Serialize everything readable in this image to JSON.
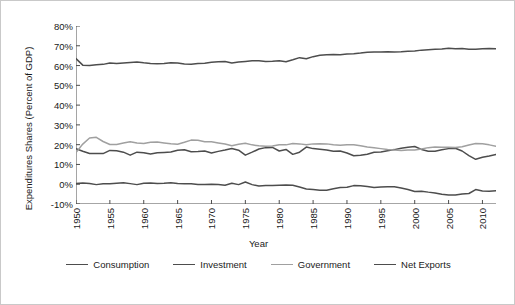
{
  "chart_data": {
    "type": "line",
    "title": "",
    "xlabel": "Year",
    "ylabel": "Expenditures Shares (Percent of GDP)",
    "xlim": [
      1950,
      2012
    ],
    "ylim": [
      -10,
      80
    ],
    "grid": false,
    "legend_position": "bottom",
    "ytick_labels": [
      "80%",
      "70%",
      "60%",
      "50%",
      "40%",
      "30%",
      "20%",
      "10%",
      "0%",
      "-10%"
    ],
    "ytick_values": [
      80,
      70,
      60,
      50,
      40,
      30,
      20,
      10,
      0,
      -10
    ],
    "xtick_labels": [
      "1950",
      "1955",
      "1960",
      "1965",
      "1970",
      "1975",
      "1980",
      "1985",
      "1990",
      "1995",
      "2000",
      "2005",
      "2010"
    ],
    "xtick_values": [
      1950,
      1955,
      1960,
      1965,
      1970,
      1975,
      1980,
      1985,
      1990,
      1995,
      2000,
      2005,
      2010
    ],
    "x": [
      1950,
      1951,
      1952,
      1953,
      1954,
      1955,
      1956,
      1957,
      1958,
      1959,
      1960,
      1961,
      1962,
      1963,
      1964,
      1965,
      1966,
      1967,
      1968,
      1969,
      1970,
      1971,
      1972,
      1973,
      1974,
      1975,
      1976,
      1977,
      1978,
      1979,
      1980,
      1981,
      1982,
      1983,
      1984,
      1985,
      1986,
      1987,
      1988,
      1989,
      1990,
      1991,
      1992,
      1993,
      1994,
      1995,
      1996,
      1997,
      1998,
      1999,
      2000,
      2001,
      2002,
      2003,
      2004,
      2005,
      2006,
      2007,
      2008,
      2009,
      2010,
      2011,
      2012
    ],
    "series": [
      {
        "name": "Consumption",
        "color": "#4d4d4d",
        "values": [
          63.5,
          60.2,
          60.0,
          60.4,
          60.6,
          61.3,
          61.0,
          61.3,
          61.6,
          61.8,
          61.4,
          61.1,
          60.9,
          61.0,
          61.4,
          61.3,
          60.8,
          60.7,
          61.0,
          61.2,
          61.7,
          61.9,
          62.0,
          61.3,
          61.8,
          62.1,
          62.4,
          62.4,
          62.1,
          62.2,
          62.4,
          61.9,
          62.9,
          64.0,
          63.4,
          64.5,
          65.2,
          65.5,
          65.6,
          65.5,
          65.9,
          66.0,
          66.3,
          66.7,
          66.9,
          66.9,
          67.0,
          66.9,
          67.0,
          67.2,
          67.4,
          67.8,
          68.0,
          68.2,
          68.4,
          68.8,
          68.5,
          68.6,
          68.2,
          68.2,
          68.5,
          68.6,
          68.5
        ]
      },
      {
        "name": "Investment",
        "color": "#4d4d4d",
        "values": [
          18.0,
          16.7,
          15.5,
          15.5,
          15.5,
          17.1,
          16.9,
          16.2,
          14.7,
          16.2,
          15.9,
          15.3,
          15.9,
          16.1,
          16.3,
          17.2,
          17.4,
          16.4,
          16.5,
          16.8,
          15.8,
          16.6,
          17.3,
          18.1,
          17.2,
          14.7,
          16.2,
          17.8,
          18.5,
          18.6,
          16.8,
          17.6,
          15.1,
          16.2,
          18.8,
          18.0,
          17.7,
          17.3,
          16.7,
          16.8,
          15.8,
          14.4,
          14.6,
          15.2,
          16.2,
          16.3,
          16.9,
          17.5,
          18.2,
          18.7,
          19.1,
          17.6,
          16.7,
          16.7,
          17.4,
          18.0,
          18.2,
          16.8,
          14.5,
          12.6,
          13.6,
          14.3,
          15.1
        ]
      },
      {
        "name": "Government",
        "color": "#a0a0a0",
        "values": [
          16.0,
          20.3,
          23.4,
          23.7,
          21.6,
          20.1,
          20.1,
          20.8,
          21.5,
          20.8,
          20.6,
          21.2,
          21.3,
          20.9,
          20.5,
          20.2,
          21.2,
          22.3,
          22.2,
          21.5,
          21.5,
          20.9,
          20.3,
          19.5,
          20.2,
          20.7,
          19.9,
          19.4,
          19.2,
          19.3,
          20.0,
          19.9,
          20.6,
          20.4,
          19.9,
          20.4,
          20.5,
          20.4,
          19.9,
          19.7,
          20.0,
          20.0,
          19.4,
          18.8,
          18.4,
          18.0,
          17.6,
          17.3,
          17.1,
          17.3,
          17.3,
          17.8,
          18.5,
          18.8,
          18.7,
          18.7,
          18.6,
          18.9,
          19.8,
          20.6,
          20.5,
          19.9,
          19.2
        ]
      },
      {
        "name": "Net Exports",
        "color": "#4d4d4d",
        "values": [
          0.4,
          0.6,
          0.4,
          -0.2,
          0.2,
          0.2,
          0.5,
          0.8,
          0.3,
          -0.2,
          0.5,
          0.6,
          0.4,
          0.5,
          0.8,
          0.4,
          0.2,
          0.2,
          -0.1,
          -0.1,
          0.0,
          -0.2,
          -0.5,
          0.5,
          -0.2,
          1.1,
          -0.2,
          -0.9,
          -0.7,
          -0.6,
          -0.5,
          -0.4,
          -0.5,
          -1.4,
          -2.4,
          -2.7,
          -3.0,
          -3.1,
          -2.3,
          -1.7,
          -1.5,
          -0.7,
          -0.8,
          -1.2,
          -1.6,
          -1.4,
          -1.3,
          -1.3,
          -1.9,
          -2.7,
          -3.7,
          -3.5,
          -4.0,
          -4.4,
          -5.1,
          -5.5,
          -5.5,
          -4.9,
          -4.7,
          -2.7,
          -3.4,
          -3.6,
          -3.3
        ]
      }
    ]
  },
  "legend": {
    "items": [
      {
        "label": "Consumption",
        "color": "#4d4d4d"
      },
      {
        "label": "Investment",
        "color": "#4d4d4d"
      },
      {
        "label": "Government",
        "color": "#a0a0a0"
      },
      {
        "label": "Net Exports",
        "color": "#4d4d4d"
      }
    ]
  },
  "axes": {
    "y_title": "Expenditures Shares (Percent of GDP)",
    "x_title": "Year"
  }
}
